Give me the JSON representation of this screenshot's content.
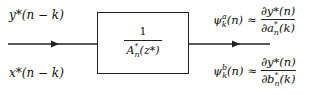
{
  "diagram": {
    "inputs": {
      "top_label": "y*(n − k)",
      "bottom_label": "x*(n − k)"
    },
    "block": {
      "numerator": "1",
      "denominator": "A*n(z*)",
      "denominator_parts": {
        "base": "A",
        "sup": "*",
        "sub": "n",
        "arg": "(z*)"
      }
    },
    "outputs": {
      "top": {
        "lhs": {
          "base": "ψ",
          "sup": "a",
          "sub": "k",
          "arg": "(n)"
        },
        "approx": "≈",
        "numerator": "∂y*(n)",
        "denominator": "∂a*n(k)",
        "den_parts": {
          "pre": "∂a",
          "sup": "*",
          "sub": "n",
          "arg": "(k)"
        }
      },
      "bottom": {
        "lhs": {
          "base": "ψ",
          "sup": "b",
          "sub": "k",
          "arg": "(n)"
        },
        "approx": "≈",
        "numerator": "∂y*(n)",
        "denominator": "∂b*n(k)",
        "den_parts": {
          "pre": "∂b",
          "sup": "*",
          "sub": "n",
          "arg": "(k)"
        }
      }
    },
    "colors": {
      "line": "#222222",
      "background": "#ffffff"
    }
  }
}
